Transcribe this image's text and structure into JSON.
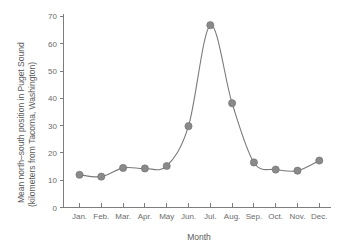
{
  "chart_data": {
    "type": "line",
    "title": "",
    "xlabel": "Month",
    "ylabel": "Mean north–south position in Puget Sound (kilometers from Tacoma, Washington)",
    "ylabel_line1": "Mean north–south position in Puget Sound",
    "ylabel_line2": "(kilometers from Tacoma, Washington)",
    "categories": [
      "Jan.",
      "Feb.",
      "Mar.",
      "Apr.",
      "May",
      "Jun.",
      "Jul.",
      "Aug.",
      "Sep.",
      "Oct.",
      "Nov.",
      "Dec."
    ],
    "values": [
      12.0,
      11.3,
      14.5,
      14.3,
      15.2,
      29.8,
      66.8,
      38.2,
      16.5,
      13.9,
      13.5,
      17.2
    ],
    "ylim": [
      0,
      70
    ],
    "yticks": [
      0,
      10,
      20,
      30,
      40,
      50,
      60,
      70
    ],
    "ytick_labels": [
      "0",
      "10",
      "20",
      "30",
      "40",
      "50",
      "60",
      "70"
    ],
    "xtick_labels": [
      "Jan.",
      "Feb.",
      "Mar.",
      "Apr.",
      "May",
      "Jun.",
      "Jul.",
      "Aug.",
      "Sep.",
      "Oct.",
      "Nov.",
      "Dec."
    ],
    "grid": false,
    "legend": null,
    "legend_position": "none",
    "marker": "circle",
    "line_color": "#7a7a7a",
    "marker_color": "#8a8a8a",
    "axis_color": "#7d7d7d",
    "text_color": "#5a5a5a",
    "background_color": "#ffffff",
    "smoothing": "spline"
  }
}
